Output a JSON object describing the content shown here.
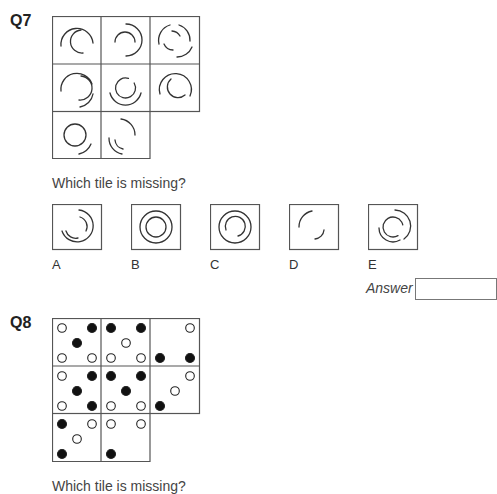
{
  "q7": {
    "number": "Q7",
    "prompt": "Which tile is missing?",
    "grid": {
      "rows": 3,
      "cols": 3,
      "tiles": [
        {
          "pos": "r1c1",
          "arcs": [
            {
              "r": 16,
              "start": 150,
              "end": 360,
              "note": "outer arc top-right open left"
            },
            {
              "r": 10,
              "start": 60,
              "end": 290
            }
          ]
        },
        {
          "pos": "r1c2",
          "arcs": [
            {
              "r": 16,
              "start": 270,
              "end": 450
            },
            {
              "r": 10,
              "start": 180,
              "end": 360
            }
          ]
        },
        {
          "pos": "r1c3",
          "arcs": [
            {
              "r": 16,
              "start": 190,
              "end": 280
            },
            {
              "r": 16,
              "start": 340,
              "end": 440
            },
            {
              "r": 10,
              "start": 80,
              "end": 190
            },
            {
              "r": 10,
              "start": 300,
              "end": 10
            }
          ]
        },
        {
          "pos": "r2c1",
          "arcs": [
            {
              "r": 16,
              "start": 170,
              "end": 360
            },
            {
              "r": 16,
              "start": 20,
              "end": 80
            },
            {
              "r": 10,
              "start": 270,
              "end": 450
            }
          ]
        },
        {
          "pos": "r2c2",
          "arcs": [
            {
              "r": 16,
              "start": 0,
              "end": 180
            },
            {
              "r": 10,
              "start": 0,
              "end": 360
            }
          ]
        },
        {
          "pos": "r2c3",
          "arcs": [
            {
              "r": 16,
              "start": 190,
              "end": 440
            },
            {
              "r": 10,
              "start": 100,
              "end": 350
            }
          ]
        },
        {
          "pos": "r3c1",
          "arcs": [
            {
              "r": 11,
              "start": 0,
              "end": 360
            },
            {
              "r": 17,
              "start": 20,
              "end": 80
            }
          ]
        },
        {
          "pos": "r3c2",
          "arcs": [
            {
              "r": 16,
              "start": 270,
              "end": 360
            },
            {
              "r": 16,
              "start": 90,
              "end": 180
            },
            {
              "r": 10,
              "start": 90,
              "end": 180
            }
          ]
        },
        {
          "pos": "r3c3",
          "missing": true
        }
      ]
    },
    "options": [
      {
        "label": "A"
      },
      {
        "label": "B"
      },
      {
        "label": "C"
      },
      {
        "label": "D"
      },
      {
        "label": "E"
      }
    ],
    "answer_label": "Answer",
    "answer_value": ""
  },
  "q8": {
    "number": "Q8",
    "prompt": "Which tile is missing?",
    "grid": {
      "rows": 3,
      "cols": 3,
      "tiles": [
        {
          "pos": "r1c1",
          "dots": {
            "tl": "open",
            "tr": "filled",
            "c": "filled",
            "bl": "open",
            "br": "open"
          }
        },
        {
          "pos": "r1c2",
          "dots": {
            "tl": "filled",
            "tr": "filled",
            "c": "open",
            "bl": "open",
            "br": "open"
          }
        },
        {
          "pos": "r1c3",
          "dots": {
            "tr": "open",
            "bl": "filled",
            "br": "filled"
          }
        },
        {
          "pos": "r2c1",
          "dots": {
            "tl": "open",
            "tr": "filled",
            "c": "filled",
            "bl": "open",
            "br": "filled"
          }
        },
        {
          "pos": "r2c2",
          "dots": {
            "tl": "filled",
            "tr": "filled",
            "c": "filled",
            "bl": "open",
            "br": "open"
          }
        },
        {
          "pos": "r2c3",
          "dots": {
            "tr": "open",
            "c": "open",
            "bl": "filled"
          }
        },
        {
          "pos": "r3c1",
          "dots": {
            "tl": "filled",
            "tr": "open",
            "c": "open",
            "bl": "filled"
          }
        },
        {
          "pos": "r3c2",
          "dots": {
            "tl": "open",
            "tr": "open",
            "bl": "filled"
          }
        },
        {
          "pos": "r3c3",
          "missing": true
        }
      ]
    }
  }
}
